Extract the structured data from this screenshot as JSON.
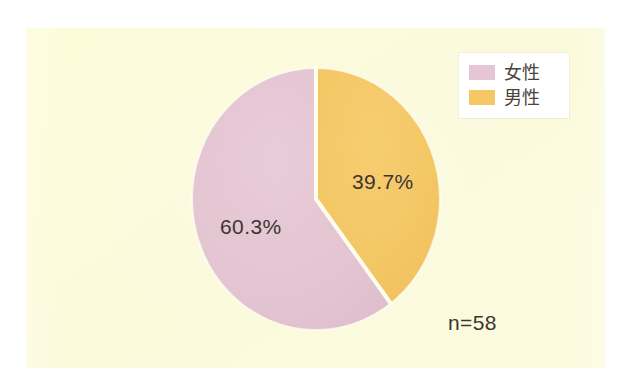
{
  "figure": {
    "panel_background": "#fdfcdd",
    "outer_background": "#ffffff",
    "sample_size_label": "n=58",
    "caption_partial": ""
  },
  "legend": {
    "position": "top-right",
    "background": "#ffffff",
    "items": [
      {
        "label": "女性",
        "color": "#e6c6d4",
        "swatch_name": "legend-swatch-female"
      },
      {
        "label": "男性",
        "color": "#f5c765",
        "swatch_name": "legend-swatch-male"
      }
    ]
  },
  "labels": {
    "female_pct": "60.3%",
    "male_pct": "39.7%"
  },
  "chart_data": {
    "type": "pie",
    "title": "",
    "subtitle": "",
    "xlabel": "",
    "ylabel": "",
    "categories": [
      "女性",
      "男性"
    ],
    "values": [
      60.3,
      39.7
    ],
    "value_unit": "%",
    "data_labels": [
      "60.3%",
      "39.7%"
    ],
    "colors": [
      "#e6c6d4",
      "#f5c765"
    ],
    "slice_order": "male starts at 12 o'clock clockwise; female fills remainder",
    "start_angle_deg": 0,
    "direction": "clockwise",
    "total": 100.0,
    "sample_size": 58,
    "annotations": [
      "n=58"
    ],
    "legend": {
      "show": true,
      "position": "top-right",
      "entries": [
        "女性",
        "男性"
      ]
    },
    "grid": false,
    "separator_color": "#ffffff"
  }
}
